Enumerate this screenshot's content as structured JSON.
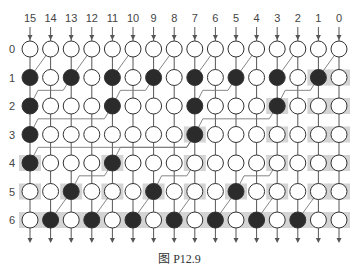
{
  "figure": {
    "caption": "图 P12.9",
    "column_labels": [
      "15",
      "14",
      "13",
      "12",
      "11",
      "10",
      "9",
      "8",
      "7",
      "6",
      "5",
      "4",
      "3",
      "2",
      "1",
      "0"
    ],
    "row_labels": [
      "0",
      "1",
      "2",
      "3",
      "4",
      "5",
      "6"
    ],
    "colors": {
      "node_fill_open": "#ffffff",
      "node_fill_black": "#2b2b2b",
      "node_stroke": "#333333",
      "wire": "#555555",
      "diag_wire": "#777777",
      "shade": "#d4d4d4",
      "text": "#444444"
    },
    "black_nodes": {
      "1": [
        15,
        13,
        11,
        9,
        7,
        5,
        3,
        1
      ],
      "2": [
        15,
        11,
        7,
        3
      ],
      "3": [
        15,
        7
      ],
      "4": [
        15,
        11
      ],
      "5": [
        13,
        9,
        5
      ],
      "6": [
        14,
        12,
        10,
        8,
        6,
        4,
        2
      ]
    },
    "shaded_nodes": {
      "1": [
        1,
        0
      ],
      "2": [
        3,
        1,
        0
      ],
      "3": [
        7,
        3,
        1,
        0
      ],
      "4": [
        15,
        11,
        7,
        3,
        1,
        0
      ],
      "5": [
        15,
        13,
        11,
        9,
        7,
        5,
        3,
        1,
        0
      ],
      "6": "all"
    },
    "diagonal_edges": [
      {
        "from_row": 0,
        "from_col": 14,
        "to_row": 1,
        "to_col": 15
      },
      {
        "from_row": 0,
        "from_col": 12,
        "to_row": 1,
        "to_col": 13
      },
      {
        "from_row": 0,
        "from_col": 10,
        "to_row": 1,
        "to_col": 11
      },
      {
        "from_row": 0,
        "from_col": 8,
        "to_row": 1,
        "to_col": 9
      },
      {
        "from_row": 0,
        "from_col": 6,
        "to_row": 1,
        "to_col": 7
      },
      {
        "from_row": 0,
        "from_col": 4,
        "to_row": 1,
        "to_col": 5
      },
      {
        "from_row": 0,
        "from_col": 2,
        "to_row": 1,
        "to_col": 3
      },
      {
        "from_row": 0,
        "from_col": 0,
        "to_row": 1,
        "to_col": 1
      },
      {
        "from_row": 1,
        "from_col": 13,
        "to_row": 2,
        "to_col": 15
      },
      {
        "from_row": 1,
        "from_col": 9,
        "to_row": 2,
        "to_col": 11
      },
      {
        "from_row": 1,
        "from_col": 5,
        "to_row": 2,
        "to_col": 7
      },
      {
        "from_row": 1,
        "from_col": 1,
        "to_row": 2,
        "to_col": 3
      },
      {
        "from_row": 2,
        "from_col": 11,
        "to_row": 3,
        "to_col": 15
      },
      {
        "from_row": 2,
        "from_col": 3,
        "to_row": 3,
        "to_col": 7
      },
      {
        "from_row": 3,
        "from_col": 7,
        "to_row": 4,
        "to_col": 15
      },
      {
        "from_row": 3,
        "from_col": 7,
        "to_row": 4,
        "to_col": 11
      },
      {
        "from_row": 4,
        "from_col": 11,
        "to_row": 5,
        "to_col": 13
      },
      {
        "from_row": 4,
        "from_col": 7,
        "to_row": 5,
        "to_col": 9
      },
      {
        "from_row": 4,
        "from_col": 3,
        "to_row": 5,
        "to_col": 5
      },
      {
        "from_row": 5,
        "from_col": 13,
        "to_row": 6,
        "to_col": 14
      },
      {
        "from_row": 5,
        "from_col": 11,
        "to_row": 6,
        "to_col": 12
      },
      {
        "from_row": 5,
        "from_col": 9,
        "to_row": 6,
        "to_col": 10
      },
      {
        "from_row": 5,
        "from_col": 7,
        "to_row": 6,
        "to_col": 8
      },
      {
        "from_row": 5,
        "from_col": 5,
        "to_row": 6,
        "to_col": 6
      },
      {
        "from_row": 5,
        "from_col": 3,
        "to_row": 6,
        "to_col": 4
      },
      {
        "from_row": 5,
        "from_col": 1,
        "to_row": 6,
        "to_col": 2
      }
    ]
  }
}
